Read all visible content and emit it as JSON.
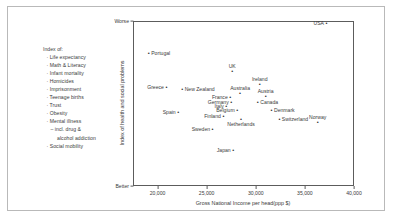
{
  "legend": {
    "title": "Index of:",
    "items": [
      {
        "text": "· Life expectancy",
        "indent": 1
      },
      {
        "text": "· Math & Literacy",
        "indent": 1
      },
      {
        "text": "· Infant mortality",
        "indent": 1
      },
      {
        "text": "· Homicides",
        "indent": 1
      },
      {
        "text": "· Imprisonment",
        "indent": 1
      },
      {
        "text": "· Teenage births",
        "indent": 1
      },
      {
        "text": "· Trust",
        "indent": 1
      },
      {
        "text": "· Obesity",
        "indent": 1
      },
      {
        "text": "· Mental illness",
        "indent": 1
      },
      {
        "text": "– incl. drug &",
        "indent": 2
      },
      {
        "text": "alcohol addiction",
        "indent": 3
      },
      {
        "text": "· Social mobility",
        "indent": 1
      }
    ]
  },
  "chart_data": {
    "type": "scatter",
    "title": "",
    "xlabel": "Gross National Income per head(ppp $)",
    "ylabel": "Index of health and social problems",
    "xlim": [
      17500,
      40000
    ],
    "ylim": [
      0,
      1
    ],
    "grid": false,
    "legend_position": "none",
    "xticks": [
      {
        "value": 20000,
        "label": "20,000"
      },
      {
        "value": 25000,
        "label": "25,000"
      },
      {
        "value": 30000,
        "label": "30,000"
      },
      {
        "value": 35000,
        "label": "35,000"
      },
      {
        "value": 40000,
        "label": "40,000"
      }
    ],
    "yticks": [
      {
        "value": 1,
        "label": "Worse"
      },
      {
        "value": 0,
        "label": "Better"
      }
    ],
    "points": [
      {
        "name": "USA",
        "x": 37100,
        "y": 0.985,
        "label_side": "left"
      },
      {
        "name": "Portugal",
        "x": 19000,
        "y": 0.805,
        "label_side": "right"
      },
      {
        "name": "UK",
        "x": 27500,
        "y": 0.7,
        "label_side": "above"
      },
      {
        "name": "Greece",
        "x": 20800,
        "y": 0.598,
        "label_side": "left"
      },
      {
        "name": "New Zealand",
        "x": 22400,
        "y": 0.585,
        "label_side": "right"
      },
      {
        "name": "Ireland",
        "x": 30300,
        "y": 0.62,
        "label_side": "above"
      },
      {
        "name": "Australia",
        "x": 28300,
        "y": 0.562,
        "label_side": "above"
      },
      {
        "name": "France",
        "x": 27300,
        "y": 0.54,
        "label_side": "left"
      },
      {
        "name": "Austria",
        "x": 30900,
        "y": 0.548,
        "label_side": "above"
      },
      {
        "name": "Germany",
        "x": 27400,
        "y": 0.512,
        "label_side": "left"
      },
      {
        "name": "Canada",
        "x": 30100,
        "y": 0.508,
        "label_side": "right"
      },
      {
        "name": "Italy",
        "x": 26900,
        "y": 0.482,
        "label_side": "left"
      },
      {
        "name": "Belgium",
        "x": 28000,
        "y": 0.462,
        "label_side": "left"
      },
      {
        "name": "Denmark",
        "x": 31500,
        "y": 0.462,
        "label_side": "right"
      },
      {
        "name": "Spain",
        "x": 22000,
        "y": 0.448,
        "label_side": "left"
      },
      {
        "name": "Finland",
        "x": 26600,
        "y": 0.425,
        "label_side": "left"
      },
      {
        "name": "Switzerland",
        "x": 32300,
        "y": 0.405,
        "label_side": "right"
      },
      {
        "name": "Norway",
        "x": 36200,
        "y": 0.385,
        "label_side": "above"
      },
      {
        "name": "Netherlands",
        "x": 28400,
        "y": 0.408,
        "label_side": "below"
      },
      {
        "name": "Sweden",
        "x": 25500,
        "y": 0.348,
        "label_side": "left"
      },
      {
        "name": "Japan",
        "x": 27600,
        "y": 0.218,
        "label_side": "left"
      }
    ]
  }
}
